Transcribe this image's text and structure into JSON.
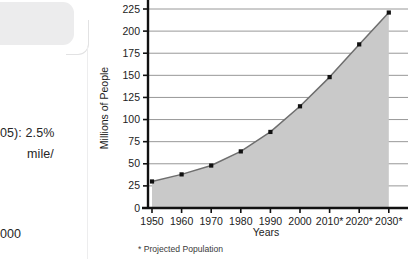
{
  "page_margin": {
    "text_fragments": [
      "05):  2.5%",
      "mile/",
      "000"
    ],
    "callout_shape": "rounded-callout-box"
  },
  "chart_data": {
    "type": "area",
    "title": "",
    "xlabel": "Years",
    "ylabel": "Millions of People",
    "categories": [
      "1950",
      "1960",
      "1970",
      "1980",
      "1990",
      "2000",
      "2010*",
      "2020*",
      "2030*"
    ],
    "x": [
      1950,
      1960,
      1970,
      1980,
      1990,
      2000,
      2010,
      2020,
      2030
    ],
    "values": [
      30,
      38,
      48,
      64,
      86,
      115,
      148,
      185,
      221
    ],
    "ylim": [
      0,
      225
    ],
    "yticks": [
      0,
      25,
      50,
      75,
      100,
      125,
      150,
      175,
      200,
      225
    ],
    "ytick_labels": [
      "0",
      "25",
      "50",
      "75",
      "100",
      "125",
      "150",
      "175",
      "200",
      "225"
    ],
    "grid": true,
    "legend": "none",
    "footnote": "*  Projected Population",
    "colors": {
      "area_fill": "#c9c9c9",
      "line": "#6e6e6e",
      "marker": "#111111",
      "axis": "#111111",
      "gridline": "#8c8c8c"
    },
    "markers": "filled-square"
  }
}
